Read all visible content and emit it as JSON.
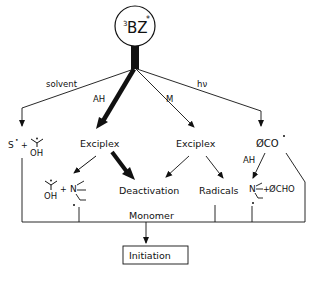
{
  "diagram": {
    "center_node": {
      "base": "BZ",
      "superscript_pre": "3",
      "superscript_post": "*"
    },
    "edge_labels": {
      "solvent": "solvent",
      "ah": "AH",
      "m": "M",
      "hv": "hν",
      "ah_right": "AH"
    },
    "nodes": {
      "solvent_products": {
        "radical": "S",
        "dot": "•",
        "plus": "+",
        "ketyl": "OH"
      },
      "exciplex_left": "Exciplex",
      "exciplex_right": "Exciplex",
      "ketyl_amine": {
        "ketyl": "OH",
        "plus": "+",
        "amine": "N"
      },
      "deactivation": "Deactivation",
      "radicals": "Radicals",
      "benzoyl": "ØCO",
      "amine_aldehyde": {
        "amine": "N",
        "plus": "+",
        "aldehyde": "ØCHO"
      },
      "monomer": "Monomer",
      "initiation": "Initiation"
    },
    "colors": {
      "ink": "#111111",
      "background": "#ffffff"
    }
  }
}
